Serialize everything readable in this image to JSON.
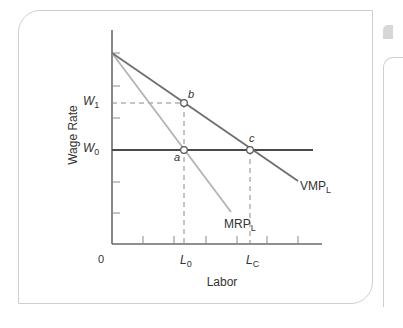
{
  "chart_data": {
    "type": "line",
    "title": "",
    "xlabel": "Labor",
    "ylabel": "Wage Rate",
    "origin_label": "0",
    "x_tick_labels": [
      {
        "label": "L",
        "sub": "0",
        "x": 185
      },
      {
        "label": "L",
        "sub": "C",
        "x": 251
      }
    ],
    "y_tick_labels": [
      {
        "label": "W",
        "sub": "1",
        "y": 103
      },
      {
        "label": "W",
        "sub": "0",
        "y": 150
      }
    ],
    "series": [
      {
        "name": "VMP_L",
        "label": "VMP",
        "label_sub": "L",
        "color": "#6e6e6e",
        "points": [
          [
            112,
            53
          ],
          [
            298,
            181
          ]
        ]
      },
      {
        "name": "MRP_L",
        "label": "MRP",
        "label_sub": "L",
        "color": "#b3b3b3",
        "points": [
          [
            112,
            53
          ],
          [
            231,
            212
          ]
        ]
      },
      {
        "name": "W0 supply",
        "label": "",
        "color": "#4a4a4a",
        "points": [
          [
            112,
            150
          ],
          [
            313,
            150
          ]
        ]
      }
    ],
    "points": [
      {
        "label": "a",
        "x": 184,
        "y": 150,
        "meaning": "L0 at W0 on MRP_L"
      },
      {
        "label": "b",
        "x": 184,
        "y": 103,
        "meaning": "L0 at W1 on VMP_L"
      },
      {
        "label": "c",
        "x": 250,
        "y": 150,
        "meaning": "LC at W0 on VMP_L"
      }
    ],
    "guides": [
      {
        "type": "dashed-h",
        "from": [
          112,
          103
        ],
        "to": [
          184,
          103
        ]
      },
      {
        "type": "dashed-v",
        "from": [
          184,
          103
        ],
        "to": [
          184,
          244
        ]
      },
      {
        "type": "dashed-v",
        "from": [
          250,
          150
        ],
        "to": [
          250,
          244
        ]
      }
    ],
    "axes": {
      "origin": [
        112,
        244
      ],
      "y_top": 30,
      "x_right": 322,
      "y_ticks": [
        53,
        86,
        118,
        182,
        213
      ],
      "x_ticks": [
        143,
        174,
        206,
        237,
        267,
        298
      ]
    },
    "grid": false,
    "legend": "none (inline curve labels)"
  }
}
